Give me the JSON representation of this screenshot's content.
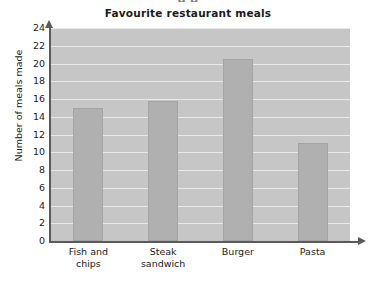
{
  "clipped_header_text": "g p",
  "chart_data": {
    "type": "bar",
    "title": "Favourite restaurant meals",
    "xlabel": "",
    "ylabel": "Number of meals made",
    "categories": [
      "Fish and chips",
      "Steak sandwich",
      "Burger",
      "Pasta"
    ],
    "category_lines": [
      [
        "Fish and",
        "chips"
      ],
      [
        "Steak",
        "sandwich"
      ],
      [
        "Burger"
      ],
      [
        "Pasta"
      ]
    ],
    "values": [
      15,
      15.8,
      20.5,
      11
    ],
    "ylim": [
      0,
      24
    ],
    "ytick_step": 2,
    "yticks": [
      0,
      2,
      4,
      6,
      8,
      10,
      12,
      14,
      16,
      18,
      20,
      22,
      24
    ],
    "grid": true,
    "grid_axis": "y",
    "legend": false,
    "colors": {
      "bar_fill": "#b0b0b0",
      "bar_stroke": "#a4a4a4",
      "plot_background": "#c6c6c6",
      "gridline": "#e8e8e8",
      "axis": "#5a5a5a",
      "text": "#1b1b1b",
      "page_background": "#ffffff"
    }
  }
}
